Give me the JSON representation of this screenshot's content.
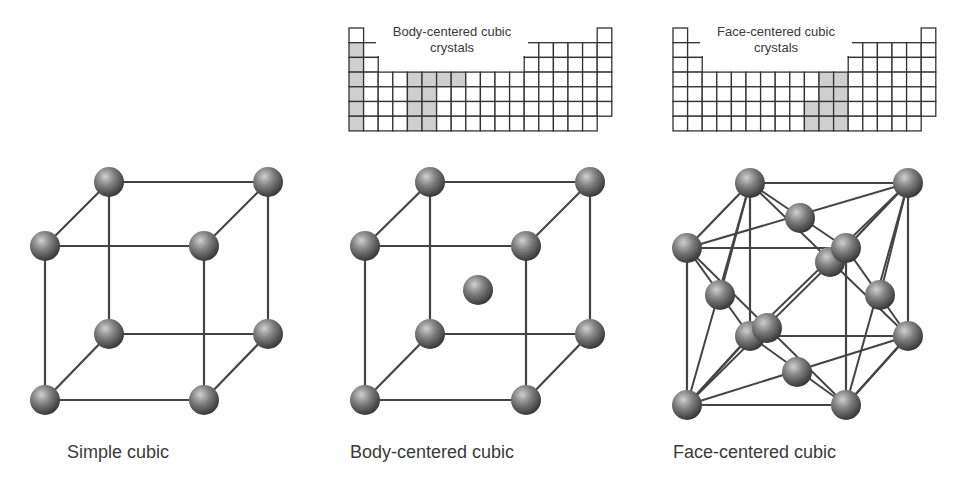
{
  "colors": {
    "line": "#444444",
    "cell_border": "#333333",
    "cell_shade": "#cfcfcf",
    "sphere_light": "#c8c8c8",
    "sphere_mid": "#7a7a7a",
    "sphere_dark": "#3a3a3a"
  },
  "periodic_tables": [
    {
      "id": "bcc",
      "title_line1": "Body-centered cubic",
      "title_line2": "crystals",
      "origin": [
        349,
        28
      ],
      "shaded": [
        [
          1,
          2
        ],
        [
          1,
          3
        ],
        [
          1,
          4
        ],
        [
          1,
          5
        ],
        [
          1,
          6
        ],
        [
          1,
          7
        ],
        [
          5,
          4
        ],
        [
          5,
          5
        ],
        [
          5,
          6
        ],
        [
          5,
          7
        ],
        [
          6,
          4
        ],
        [
          6,
          5
        ],
        [
          6,
          6
        ],
        [
          6,
          7
        ],
        [
          7,
          4
        ],
        [
          8,
          4
        ]
      ]
    },
    {
      "id": "fcc",
      "title_line1": "Face-centered cubic",
      "title_line2": "crystals",
      "origin": [
        673,
        28
      ],
      "shaded": [
        [
          10,
          6
        ],
        [
          10,
          7
        ],
        [
          11,
          4
        ],
        [
          11,
          5
        ],
        [
          11,
          6
        ],
        [
          11,
          7
        ],
        [
          12,
          4
        ],
        [
          12,
          5
        ],
        [
          12,
          6
        ],
        [
          12,
          7
        ]
      ]
    }
  ],
  "lattices": [
    {
      "id": "simple-cubic",
      "caption": "Simple cubic",
      "caption_pos": [
        67,
        442
      ],
      "corners": {
        "btl": [
          109,
          182
        ],
        "btr": [
          268,
          182
        ],
        "ftl": [
          45,
          246
        ],
        "ftr": [
          204,
          246
        ],
        "bbl": [
          109,
          334
        ],
        "bbr": [
          268,
          334
        ],
        "fbl": [
          45,
          400
        ],
        "fbr": [
          204,
          400
        ]
      },
      "extra_atoms": [],
      "extra_bonds": []
    },
    {
      "id": "body-centered-cubic",
      "caption": "Body-centered cubic",
      "caption_pos": [
        350,
        442
      ],
      "corners": {
        "btl": [
          430,
          182
        ],
        "btr": [
          590,
          182
        ],
        "ftl": [
          365,
          246
        ],
        "ftr": [
          526,
          246
        ],
        "bbl": [
          430,
          334
        ],
        "bbr": [
          590,
          334
        ],
        "fbl": [
          365,
          400
        ],
        "fbr": [
          526,
          400
        ]
      },
      "extra_atoms": [
        [
          478,
          290
        ]
      ],
      "extra_bonds": []
    },
    {
      "id": "face-centered-cubic",
      "caption": "Face-centered cubic",
      "caption_pos": [
        673,
        442
      ],
      "corners": {
        "btl": [
          750,
          183
        ],
        "btr": [
          908,
          183
        ],
        "ftl": [
          687,
          248
        ],
        "ftr": [
          846,
          248
        ],
        "bbl": [
          750,
          336
        ],
        "bbr": [
          908,
          336
        ],
        "fbl": [
          687,
          405
        ],
        "fbr": [
          846,
          405
        ]
      },
      "extra_atoms": [
        [
          800,
          218
        ],
        [
          830,
          262
        ],
        [
          720,
          295
        ],
        [
          880,
          295
        ],
        [
          767,
          328
        ],
        [
          797,
          372
        ]
      ],
      "extra_bonds": [
        [
          [
            750,
            183
          ],
          [
            846,
            248
          ]
        ],
        [
          [
            908,
            183
          ],
          [
            687,
            248
          ]
        ],
        [
          [
            750,
            183
          ],
          [
            720,
            295
          ]
        ],
        [
          [
            687,
            248
          ],
          [
            750,
            336
          ]
        ],
        [
          [
            908,
            183
          ],
          [
            846,
            405
          ]
        ],
        [
          [
            846,
            248
          ],
          [
            908,
            336
          ]
        ],
        [
          [
            908,
            183
          ],
          [
            750,
            336
          ]
        ],
        [
          [
            750,
            183
          ],
          [
            908,
            336
          ]
        ],
        [
          [
            687,
            248
          ],
          [
            846,
            405
          ]
        ],
        [
          [
            846,
            248
          ],
          [
            687,
            405
          ]
        ],
        [
          [
            750,
            183
          ],
          [
            687,
            405
          ]
        ],
        [
          [
            908,
            183
          ],
          [
            880,
            295
          ]
        ],
        [
          [
            750,
            336
          ],
          [
            846,
            405
          ]
        ],
        [
          [
            908,
            336
          ],
          [
            687,
            405
          ]
        ],
        [
          [
            750,
            336
          ],
          [
            687,
            405
          ]
        ],
        [
          [
            908,
            336
          ],
          [
            846,
            405
          ]
        ]
      ]
    }
  ]
}
